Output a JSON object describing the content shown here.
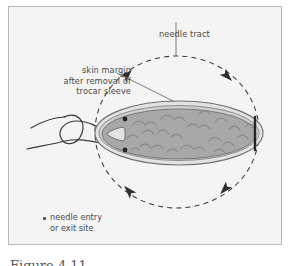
{
  "figure": {
    "background_color": "#f4f4f4",
    "frame_color": "#b9b9b9",
    "page_color": "#ffffff",
    "ink_color": "#4a4a4a",
    "lesion_fill_color": "#a8a8a8",
    "lesion_rim_color": "#cfcfcf",
    "labels": {
      "needle_tract": "needle tract",
      "skin_margin_line1": "skin margin",
      "skin_margin_line2": "after removal of",
      "skin_margin_line3": "trocar sleeve",
      "legend_line1": "needle entry",
      "legend_line2": "or exit site"
    },
    "caption_partial": "Figure 4.11"
  }
}
